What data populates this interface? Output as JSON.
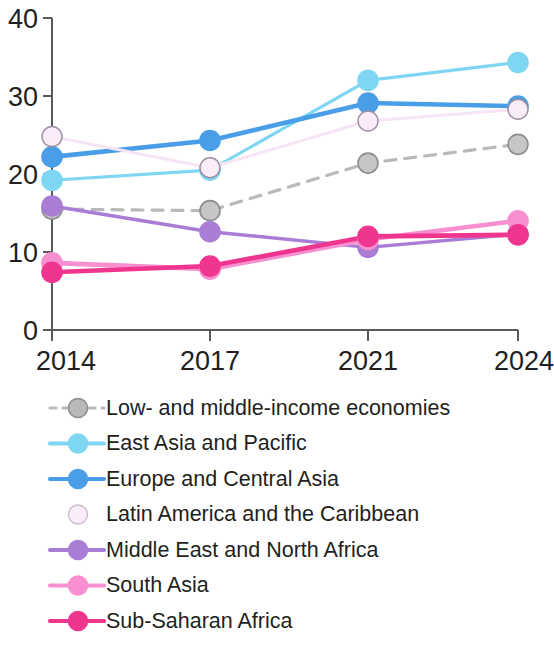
{
  "chart_data": {
    "type": "line",
    "title": "",
    "subtitle": "",
    "xlabel": "",
    "ylabel": "",
    "x": [
      "2014",
      "2017",
      "2021",
      "2024"
    ],
    "categories": [
      "2014",
      "2017",
      "2021",
      "2024"
    ],
    "xtick_labels": [
      "2014",
      "2017",
      "2021",
      "2024"
    ],
    "ytick_labels": [
      "0",
      "10",
      "20",
      "30",
      "40"
    ],
    "ytick_values": [
      0,
      10,
      20,
      30,
      40
    ],
    "ylim": [
      0,
      40
    ],
    "grid": false,
    "legend_position": "bottom-left",
    "series": [
      {
        "name": "Low- and middle-income economies",
        "values": [
          15.5,
          15.3,
          21.4,
          23.8
        ],
        "color": "#b9b9b9",
        "marker_fill": "#c6c6c6",
        "style": "dashed",
        "width": 3.2
      },
      {
        "name": "East Asia and Pacific",
        "values": [
          19.2,
          20.5,
          32.0,
          34.3
        ],
        "color": "#7fd6f2",
        "marker_fill": "#7fd6f2",
        "style": "solid",
        "width": 3.2
      },
      {
        "name": "Europe and Central Asia",
        "values": [
          22.2,
          24.3,
          29.1,
          28.7
        ],
        "color": "#4a9ee8",
        "marker_fill": "#4a9ee8",
        "style": "solid",
        "width": 4.6
      },
      {
        "name": "Latin America and the Caribbean",
        "values": [
          24.8,
          20.8,
          26.8,
          28.3
        ],
        "color": "#f7e4f5",
        "marker_fill": "#faecf8",
        "style": "solid",
        "width": 3.0
      },
      {
        "name": "Middle East and North Africa",
        "values": [
          15.9,
          12.6,
          10.6,
          12.3
        ],
        "color": "#a97dd6",
        "marker_fill": "#a97dd6",
        "style": "solid",
        "width": 3.4
      },
      {
        "name": "South Asia",
        "values": [
          8.6,
          7.8,
          11.6,
          14.0
        ],
        "color": "#f78fd0",
        "marker_fill": "#f78fd0",
        "style": "solid",
        "width": 4.6
      },
      {
        "name": "Sub-Saharan Africa",
        "values": [
          7.4,
          8.2,
          12.0,
          12.2
        ],
        "color": "#f0358f",
        "marker_fill": "#f0358f",
        "style": "solid",
        "width": 4.6
      }
    ]
  },
  "legend": {
    "items": [
      {
        "label": "Low- and middle-income economies",
        "color": "#b9b9b9",
        "style": "dashed"
      },
      {
        "label": "East Asia and Pacific",
        "color": "#7fd6f2",
        "style": "solid"
      },
      {
        "label": "Europe and Central Asia",
        "color": "#4a9ee8",
        "style": "solid"
      },
      {
        "label": "Latin America and the Caribbean",
        "color": "#f7e4f5",
        "style": "solid"
      },
      {
        "label": "Middle East and North Africa",
        "color": "#a97dd6",
        "style": "solid"
      },
      {
        "label": "South Asia",
        "color": "#f78fd0",
        "style": "solid"
      },
      {
        "label": "Sub-Saharan Africa",
        "color": "#f0358f",
        "style": "solid"
      }
    ]
  },
  "axes": {
    "axis_color": "#58595b",
    "y_ticks": [
      "0",
      "10",
      "20",
      "30",
      "40"
    ],
    "x_ticks": [
      "2014",
      "2017",
      "2021",
      "2024"
    ]
  }
}
